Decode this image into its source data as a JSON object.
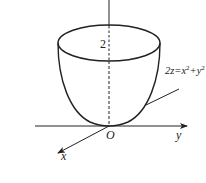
{
  "diagram": {
    "type": "3d-surface-sketch",
    "surface": "paraboloid",
    "equation_label": {
      "prefix": "2z=x",
      "sup1": "2",
      "plus": "+y",
      "sup2": "2"
    },
    "height_label": "2",
    "origin_label": "O",
    "axes": {
      "x": "x",
      "y": "y",
      "z": ""
    },
    "colors": {
      "stroke": "#222222",
      "background": "#ffffff"
    }
  }
}
